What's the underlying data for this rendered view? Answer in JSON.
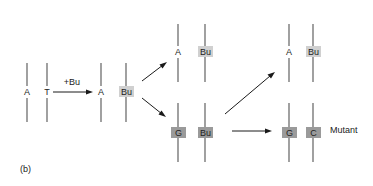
{
  "figure": {
    "panel_label": "(b)",
    "reagent_label": "+Bu",
    "mutant_label": "Mutant",
    "colors": {
      "strand": "#6e6e6e",
      "arrow": "#1a1a1a",
      "highlight_light": "#d0d0d0",
      "highlight_dark": "#9a9a9a",
      "text": "#222222"
    }
  },
  "pairs": {
    "original": {
      "left": "A",
      "right": "T"
    },
    "after_bu": {
      "left": "A",
      "right": "Bu"
    },
    "replication_top": {
      "left": "A",
      "right": "Bu"
    },
    "replication_bottom": {
      "left": "G",
      "right": "Bu"
    },
    "final_top": {
      "left": "A",
      "right": "Bu"
    },
    "final_bottom": {
      "left": "G",
      "right": "C"
    }
  }
}
